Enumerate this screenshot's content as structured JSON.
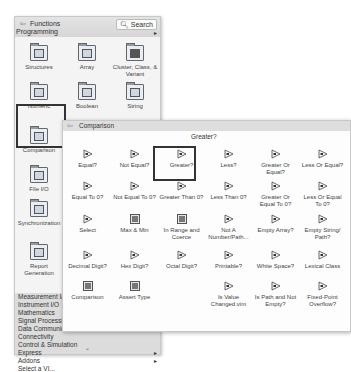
{
  "palette": {
    "back_icon": "back-arrow-icon",
    "title": "Functions",
    "category": "Programming",
    "search_label": "Search",
    "search_icon": "search-icon",
    "items": [
      {
        "label": "Structures"
      },
      {
        "label": "Array"
      },
      {
        "label": "Cluster, Class, & Variant"
      },
      {
        "label": "Numeric"
      },
      {
        "label": "Boolean"
      },
      {
        "label": "String"
      },
      {
        "label": "Comparison"
      },
      {
        "label": "File I/O"
      },
      {
        "label": "Synchronization"
      },
      {
        "label": "Report Generation"
      }
    ],
    "list": [
      {
        "label": "Measurement I/O",
        "arrow": ""
      },
      {
        "label": "Instrument I/O",
        "arrow": ""
      },
      {
        "label": "Mathematics",
        "arrow": ""
      },
      {
        "label": "Signal Processing",
        "arrow": ""
      },
      {
        "label": "Data Communication",
        "arrow": ""
      },
      {
        "label": "Connectivity",
        "arrow": ""
      },
      {
        "label": "Control & Simulation",
        "arrow": ""
      },
      {
        "label": "Express",
        "arrow": "▸"
      },
      {
        "label": "Addons",
        "arrow": "▸"
      },
      {
        "label": "Select a VI...",
        "arrow": ""
      }
    ],
    "more_arrow": "⌄"
  },
  "subpalette": {
    "title": "Comparison",
    "tooltip": "Greater?",
    "items": [
      [
        "Equal?",
        "Not Equal?",
        "Greater?",
        "Less?",
        "Greater Or Equal?",
        "Less Or Equal?"
      ],
      [
        "Equal To 0?",
        "Not Equal To 0?",
        "Greater Than 0?",
        "Less Than 0?",
        "Greater Or Equal To 0?",
        "Less Or Equal To 0?"
      ],
      [
        "Select",
        "Max & Min",
        "In Range and Coerce",
        "Not A Number/Path...",
        "Empty Array?",
        "Empty String/ Path?"
      ],
      [
        "Decimal Digit?",
        "Hex Digit?",
        "Octal Digit?",
        "Printable?",
        "White Space?",
        "Lexical Class"
      ],
      [
        "Comparison",
        "Assert Type",
        "",
        "Is Value Changed.vim",
        "Is Path and Not Empty?",
        "Fixed-Point Overflow?"
      ]
    ]
  }
}
